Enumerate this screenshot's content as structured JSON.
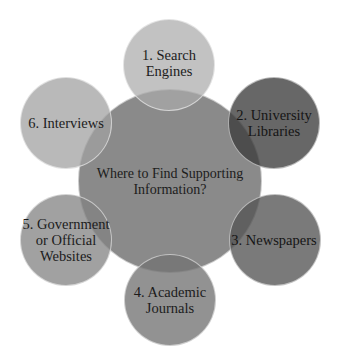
{
  "diagram": {
    "type": "radial-venn",
    "center": {
      "label": "Where to Find Supporting\nInformation?",
      "color": "#8a8a8a"
    },
    "nodes": [
      {
        "label": "1. Search\nEngines",
        "color": "#bdbdbd",
        "position": "top"
      },
      {
        "label": "2. University\nLibraries",
        "color": "#666666",
        "position": "upper-right"
      },
      {
        "label": "3. Newspapers",
        "color": "#777777",
        "position": "lower-right"
      },
      {
        "label": "4. Academic\nJournals",
        "color": "#8c8c8c",
        "position": "bottom"
      },
      {
        "label": "5. Government\nor Official\nWebsites",
        "color": "#9d9d9d",
        "position": "lower-left"
      },
      {
        "label": "6. Interviews",
        "color": "#b5b5b5",
        "position": "upper-left"
      }
    ]
  }
}
